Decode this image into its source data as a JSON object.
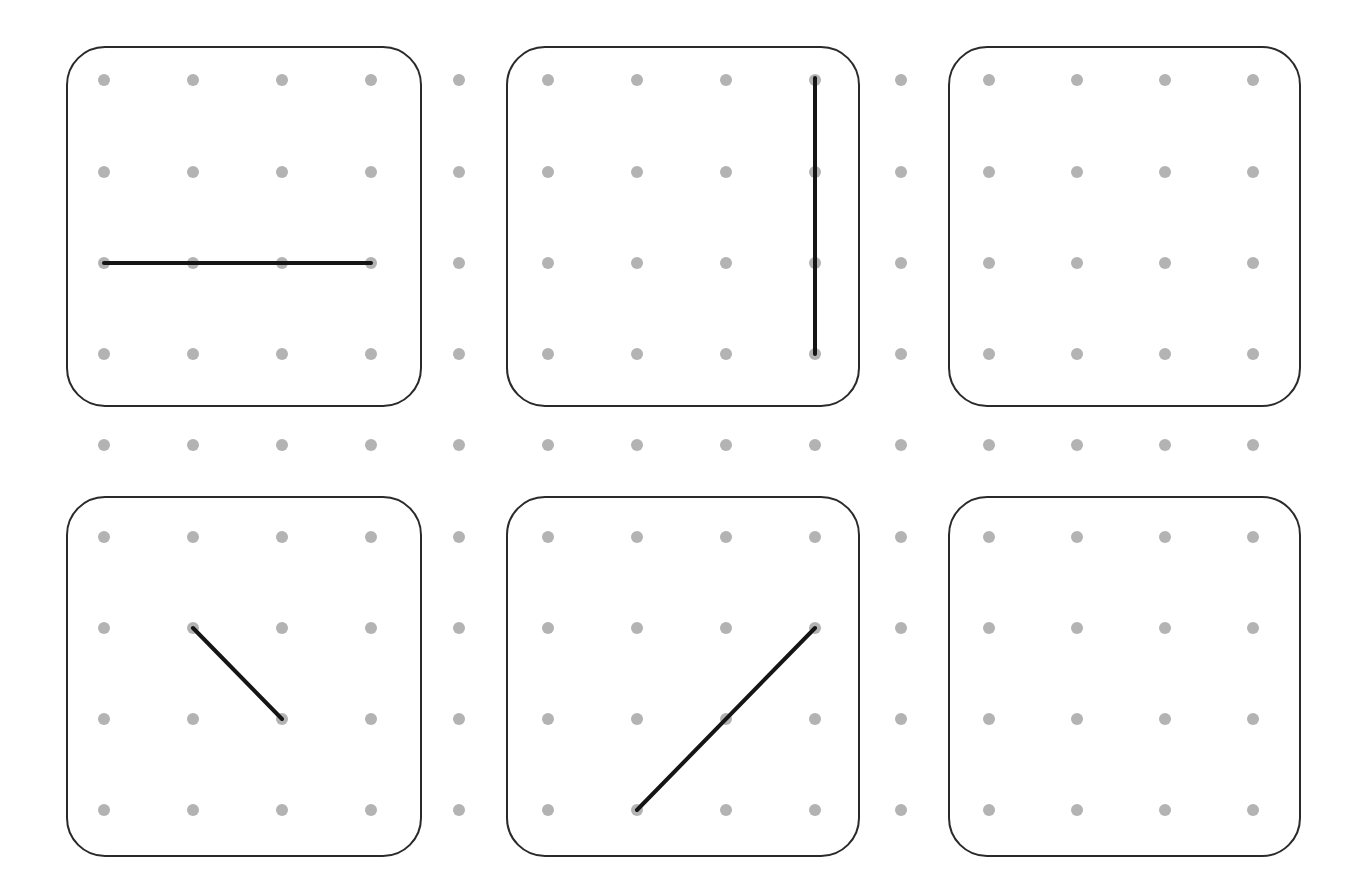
{
  "colors": {
    "dot": "#b3b3b3",
    "box_stroke": "#2a2a2a",
    "segment": "#151515",
    "background": "#ffffff"
  },
  "grid": {
    "columns_x": [
      104,
      193,
      282,
      371,
      459,
      548,
      637,
      726,
      815,
      901,
      989,
      1077,
      1165,
      1253
    ],
    "rows_y": [
      80,
      172,
      263,
      354,
      445,
      537,
      628,
      719,
      810
    ],
    "dot_radius": 6
  },
  "boxes": [
    {
      "id": "box-1",
      "x": 67,
      "y": 47,
      "w": 354,
      "h": 359,
      "segments": [
        {
          "x1": 104,
          "y1": 263,
          "x2": 371,
          "y2": 263
        }
      ]
    },
    {
      "id": "box-2",
      "x": 507,
      "y": 47,
      "w": 352,
      "h": 359,
      "segments": [
        {
          "x1": 815,
          "y1": 78,
          "x2": 815,
          "y2": 354
        }
      ]
    },
    {
      "id": "box-3",
      "x": 949,
      "y": 47,
      "w": 351,
      "h": 359,
      "segments": []
    },
    {
      "id": "box-4",
      "x": 67,
      "y": 497,
      "w": 354,
      "h": 359,
      "segments": [
        {
          "x1": 193,
          "y1": 628,
          "x2": 282,
          "y2": 719
        }
      ]
    },
    {
      "id": "box-5",
      "x": 507,
      "y": 497,
      "w": 352,
      "h": 359,
      "segments": [
        {
          "x1": 815,
          "y1": 628,
          "x2": 637,
          "y2": 810
        }
      ]
    },
    {
      "id": "box-6",
      "x": 949,
      "y": 497,
      "w": 351,
      "h": 359,
      "segments": []
    }
  ],
  "box_corner_radius": 38
}
